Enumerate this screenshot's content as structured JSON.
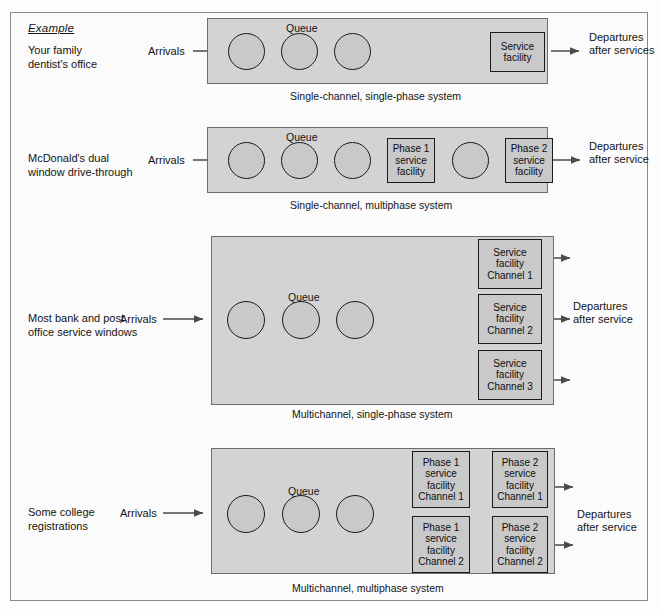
{
  "page": {
    "example_heading": "Example",
    "arrivals_label": "Arrivals",
    "queue_label": "Queue"
  },
  "systems": [
    {
      "id": "single-channel-single-phase",
      "row_label": "Your family\ndentist's office",
      "caption": "Single-channel, single-phase system",
      "departures_label": "Departures\nafter services",
      "queue_label": "Queue",
      "arrivals_label": "Arrivals",
      "facilities": [
        {
          "id": "service-facility",
          "text": "Service\nfacility"
        }
      ]
    },
    {
      "id": "single-channel-multiphase",
      "row_label": "McDonald's dual\nwindow drive-through",
      "caption": "Single-channel, multiphase system",
      "departures_label": "Departures\nafter service",
      "queue_label": "Queue",
      "arrivals_label": "Arrivals",
      "facilities": [
        {
          "id": "phase-1-service-facility",
          "text": "Phase 1\nservice\nfacility"
        },
        {
          "id": "phase-2-service-facility",
          "text": "Phase 2\nservice\nfacility"
        }
      ]
    },
    {
      "id": "multichannel-single-phase",
      "row_label": "Most bank and post\noffice service windows",
      "caption": "Multichannel, single-phase system",
      "departures_label": "Departures\nafter service",
      "queue_label": "Queue",
      "arrivals_label": "Arrivals",
      "facilities": [
        {
          "id": "service-facility-channel-1",
          "text": "Service\nfacility\nChannel 1"
        },
        {
          "id": "service-facility-channel-2",
          "text": "Service\nfacility\nChannel 2"
        },
        {
          "id": "service-facility-channel-3",
          "text": "Service\nfacility\nChannel 3"
        }
      ]
    },
    {
      "id": "multichannel-multiphase",
      "row_label": "Some college\nregistrations",
      "caption": "Multichannel, multiphase system",
      "departures_label": "Departures\nafter service",
      "queue_label": "Queue",
      "arrivals_label": "Arrivals",
      "facilities": [
        {
          "id": "phase-1-service-facility-channel-1",
          "text": "Phase 1\nservice\nfacility\nChannel 1"
        },
        {
          "id": "phase-1-service-facility-channel-2",
          "text": "Phase 1\nservice\nfacility\nChannel 2"
        },
        {
          "id": "phase-2-service-facility-channel-1",
          "text": "Phase 2\nservice\nfacility\nChannel 1"
        },
        {
          "id": "phase-2-service-facility-channel-2",
          "text": "Phase 2\nservice\nfacility\nChannel 2"
        }
      ]
    }
  ],
  "colors": {
    "system_box_fill": "#d3d3d3",
    "circle_fill": "#c9c9c9",
    "facility_fill": "#c9c9c9",
    "stroke": "#1a1a1a",
    "page_background": "#fdfdfd"
  }
}
